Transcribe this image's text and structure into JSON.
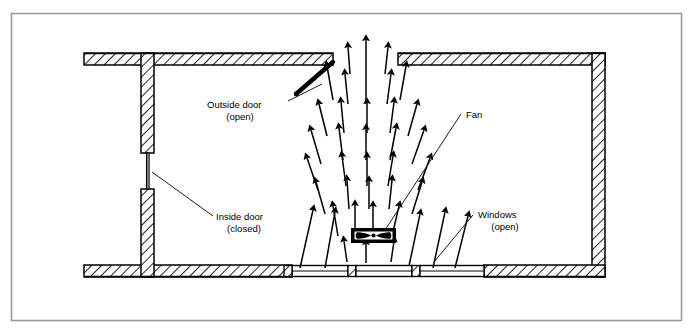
{
  "diagram": {
    "type": "architectural-airflow-schematic",
    "colors": {
      "line": "#000000",
      "background": "#ffffff",
      "frame": "#9a9a9a",
      "hatch": "#000000"
    },
    "frame": {
      "x": 11,
      "y": 13,
      "width": 671,
      "height": 308
    },
    "room": {
      "top_wall": {
        "x": 84,
        "y": 53,
        "width": 521,
        "height": 12
      },
      "bottom_wall": {
        "x": 84,
        "y": 265,
        "width": 521,
        "height": 12
      },
      "right_wall": {
        "x": 592,
        "y": 53,
        "width": 13,
        "height": 224
      },
      "left_wall_upper": {
        "x": 141,
        "y": 53,
        "width": 13,
        "height": 100
      },
      "left_wall_lower": {
        "x": 141,
        "y": 189,
        "width": 13,
        "height": 88
      }
    },
    "labels": [
      {
        "id": "outside-door",
        "line1": "Outside door",
        "line2": "(open)",
        "x": 207,
        "y": 105
      },
      {
        "id": "inside-door",
        "line1": "Inside door",
        "line2": "(closed)",
        "x": 216,
        "y": 220
      },
      {
        "id": "fan",
        "line1": "Fan",
        "line2": "",
        "x": 466,
        "y": 115
      },
      {
        "id": "windows",
        "line1": "Windows",
        "line2": "(open)",
        "x": 478,
        "y": 215
      }
    ],
    "fan_unit": {
      "x": 351,
      "y": 228,
      "width": 45,
      "height": 15,
      "blade": "bowtie-propeller"
    },
    "airflow": {
      "description": "Expanding cone of air moving upward from the fan toward the outside door opening",
      "direction": "up",
      "arrow_count": 34
    },
    "windows_open": [
      {
        "x": 292,
        "y": 266,
        "width": 56
      },
      {
        "x": 356,
        "y": 266,
        "width": 56
      },
      {
        "x": 420,
        "y": 266,
        "width": 56
      }
    ],
    "openings": {
      "outside_door_gap": {
        "x": 333,
        "y": 53,
        "width": 45
      },
      "inside_door_gap": {
        "x": 141,
        "y": 153,
        "height": 36
      }
    }
  }
}
